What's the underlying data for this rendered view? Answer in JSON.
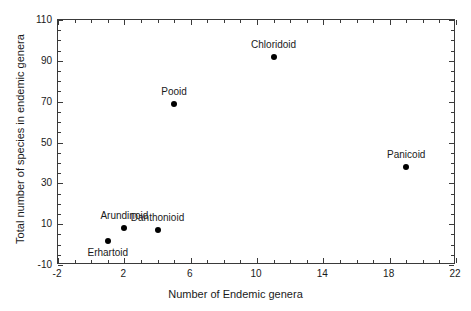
{
  "chart_data": {
    "type": "scatter",
    "title": "",
    "xlabel": "Number of Endemic genera",
    "ylabel": "Total number of species in endemic genera",
    "xlim": [
      -2,
      22
    ],
    "ylim": [
      -10,
      110
    ],
    "xticks": [
      -2,
      2,
      6,
      10,
      14,
      18,
      22
    ],
    "xtick_labels": [
      "-2",
      "2",
      "6",
      "10",
      "14",
      "18",
      "22"
    ],
    "yticks": [
      -10,
      10,
      30,
      50,
      70,
      90,
      110
    ],
    "ytick_labels": [
      "-10",
      "10",
      "30",
      "50",
      "70",
      "90",
      "110"
    ],
    "x_minor_step": 1,
    "y_minor_step": 5,
    "grid": false,
    "legend": null,
    "marker_color": "#000000",
    "axis_color": "#3a3a3a",
    "points": [
      {
        "name": "Erhartoid",
        "x": 1,
        "y": 2,
        "label_pos": "below"
      },
      {
        "name": "Arundinoid",
        "x": 2,
        "y": 8,
        "label_pos": "above"
      },
      {
        "name": "Danthonioid",
        "x": 4,
        "y": 7,
        "label_pos": "above"
      },
      {
        "name": "Pooid",
        "x": 5,
        "y": 69,
        "label_pos": "above"
      },
      {
        "name": "Chloridoid",
        "x": 11,
        "y": 92,
        "label_pos": "above"
      },
      {
        "name": "Panicoid",
        "x": 19,
        "y": 38,
        "label_pos": "above"
      }
    ]
  }
}
